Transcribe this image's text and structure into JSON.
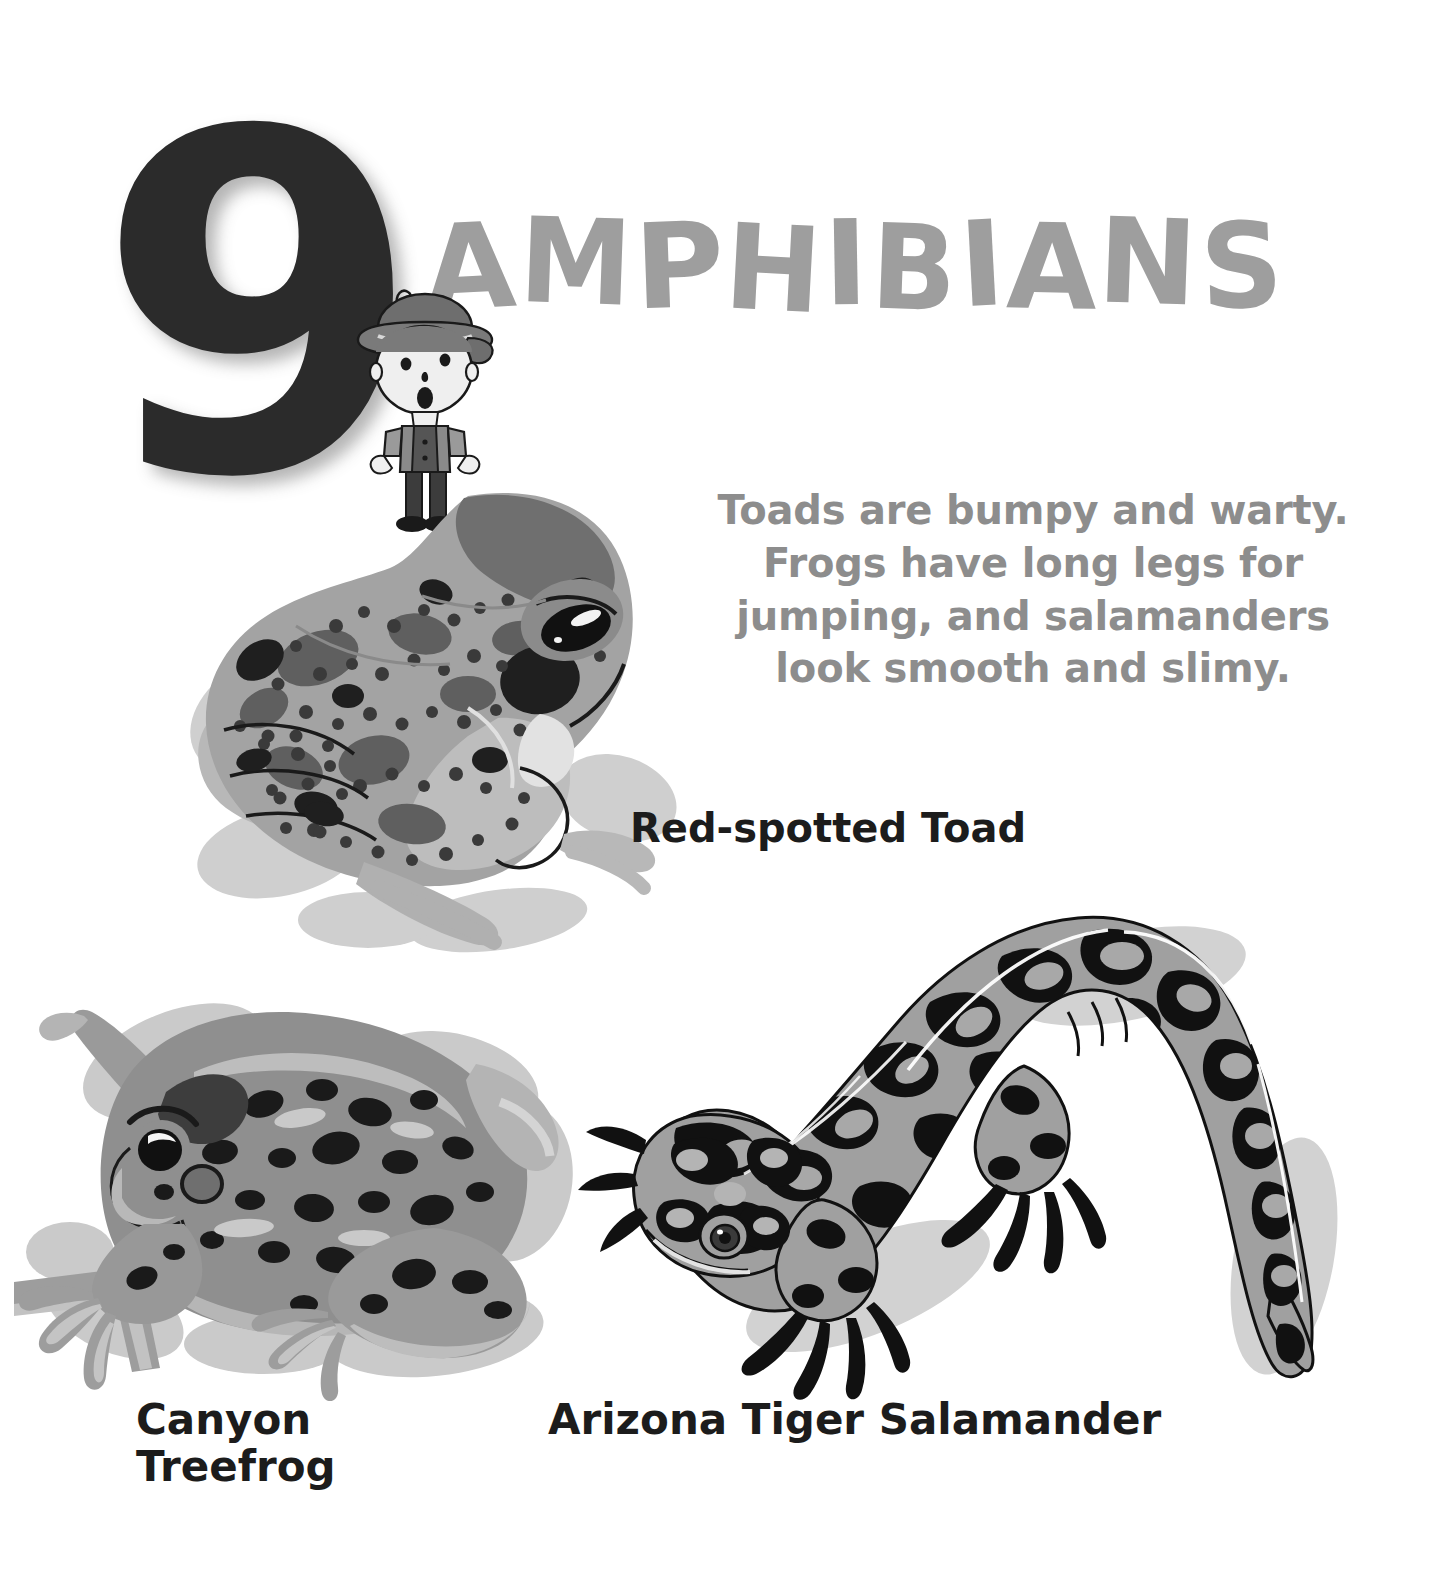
{
  "page": {
    "background": "#ffffff",
    "width": 1436,
    "height": 1570
  },
  "chapter": {
    "number": "9",
    "number_color": "#2b2b2b",
    "title": "AMPHIBIANS",
    "title_color": "#9e9e9e"
  },
  "intro": {
    "text": "Toads are bumpy and warty. Frogs have long legs for jumping, and salamanders look smooth and slimy.",
    "color": "#8d8d8d"
  },
  "figures": [
    {
      "id": "red-spotted-toad",
      "caption": "Red-spotted Toad",
      "caption_color": "#1c1c1c",
      "colors": {
        "body": "#9a9a9a",
        "body_light": "#b4b4b4",
        "shadow": "#cfcfcf",
        "spots_dark": "#6d6d6d",
        "spots_black": "#1a1a1a",
        "highlight": "#e8e8e8"
      }
    },
    {
      "id": "canyon-treefrog",
      "caption": "Canyon\nTreefrog",
      "caption_color": "#1c1c1c",
      "colors": {
        "body": "#8f8f8f",
        "body_light": "#ababab",
        "shadow": "#c9c9c9",
        "spots_black": "#1a1a1a",
        "highlight": "#dedede"
      }
    },
    {
      "id": "arizona-tiger-salamander",
      "caption": "Arizona Tiger Salamander",
      "caption_color": "#1c1c1c",
      "colors": {
        "body": "#9d9d9d",
        "pattern_black": "#111111",
        "highlight": "#ffffff",
        "shadow": "#d2d2d2"
      }
    },
    {
      "id": "explorer-boy",
      "caption": "",
      "colors": {
        "hat": "#6e6e6e",
        "hat_dark": "#4a4a4a",
        "face": "#efefef",
        "outline": "#1a1a1a",
        "shirt": "#8a8a8a",
        "overalls": "#3c3c3c",
        "skin": "#f2f2f2"
      }
    }
  ],
  "icons": {
    "toad": "toad-illustration",
    "treefrog": "treefrog-illustration",
    "salamander": "salamander-illustration",
    "explorer": "explorer-boy-illustration"
  }
}
